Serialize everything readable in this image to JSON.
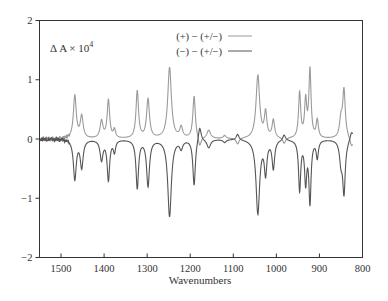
{
  "chart_data": {
    "type": "line",
    "title": "",
    "xlabel": "Wavenumbers",
    "ylabel": "",
    "annotation": "Δ A × 10⁴",
    "xlim": [
      1550,
      800
    ],
    "ylim": [
      -2,
      2
    ],
    "x_ticks": [
      1500,
      1400,
      1300,
      1200,
      1100,
      1000,
      900,
      800
    ],
    "y_ticks": [
      2,
      1,
      0,
      -1,
      -2
    ],
    "grid": false,
    "legend_position": "top-center",
    "series": [
      {
        "name": "(+) − (+/−)",
        "color": "#9a9a9a",
        "peaks": [
          {
            "x": 1468,
            "y": 0.72,
            "w": 4
          },
          {
            "x": 1452,
            "y": 0.37,
            "w": 4
          },
          {
            "x": 1406,
            "y": 0.29,
            "w": 4
          },
          {
            "x": 1390,
            "y": 0.64,
            "w": 3.5
          },
          {
            "x": 1376,
            "y": 0.14,
            "w": 3
          },
          {
            "x": 1323,
            "y": 0.8,
            "w": 3.5
          },
          {
            "x": 1298,
            "y": 0.66,
            "w": 4
          },
          {
            "x": 1248,
            "y": 1.2,
            "w": 5
          },
          {
            "x": 1221,
            "y": 0.18,
            "w": 4
          },
          {
            "x": 1191,
            "y": 0.72,
            "w": 3.5
          },
          {
            "x": 1178,
            "y": -0.17,
            "w": 4
          },
          {
            "x": 1157,
            "y": 0.14,
            "w": 5
          },
          {
            "x": 1120,
            "y": 0.05,
            "w": 4
          },
          {
            "x": 1090,
            "y": -0.1,
            "w": 4
          },
          {
            "x": 1043,
            "y": 1.06,
            "w": 5
          },
          {
            "x": 1025,
            "y": 0.42,
            "w": 3.5
          },
          {
            "x": 1007,
            "y": 0.3,
            "w": 3.5
          },
          {
            "x": 982,
            "y": -0.1,
            "w": 4
          },
          {
            "x": 946,
            "y": 0.76,
            "w": 3
          },
          {
            "x": 932,
            "y": 0.62,
            "w": 3
          },
          {
            "x": 922,
            "y": 1.15,
            "w": 3
          },
          {
            "x": 905,
            "y": 0.3,
            "w": 3
          },
          {
            "x": 850,
            "y": 0.3,
            "w": 4
          },
          {
            "x": 843,
            "y": 0.8,
            "w": 3.5
          },
          {
            "x": 826,
            "y": -0.08,
            "w": 3
          }
        ],
        "end_offset": -0.1
      },
      {
        "name": "(−) − (+/−)",
        "color": "#555555",
        "peaks": [
          {
            "x": 1468,
            "y": -0.67,
            "w": 4
          },
          {
            "x": 1452,
            "y": -0.47,
            "w": 4
          },
          {
            "x": 1406,
            "y": -0.34,
            "w": 4
          },
          {
            "x": 1390,
            "y": -0.68,
            "w": 3.5
          },
          {
            "x": 1376,
            "y": -0.2,
            "w": 3
          },
          {
            "x": 1323,
            "y": -0.82,
            "w": 3.5
          },
          {
            "x": 1298,
            "y": -0.78,
            "w": 4
          },
          {
            "x": 1248,
            "y": -1.3,
            "w": 5
          },
          {
            "x": 1221,
            "y": -0.14,
            "w": 4
          },
          {
            "x": 1191,
            "y": -0.78,
            "w": 3.5
          },
          {
            "x": 1178,
            "y": 0.25,
            "w": 4
          },
          {
            "x": 1157,
            "y": -0.14,
            "w": 5
          },
          {
            "x": 1120,
            "y": -0.05,
            "w": 4
          },
          {
            "x": 1090,
            "y": 0.1,
            "w": 4
          },
          {
            "x": 1043,
            "y": -1.25,
            "w": 5
          },
          {
            "x": 1025,
            "y": -0.55,
            "w": 3.5
          },
          {
            "x": 1007,
            "y": -0.48,
            "w": 3.5
          },
          {
            "x": 982,
            "y": 0.1,
            "w": 4
          },
          {
            "x": 946,
            "y": -0.85,
            "w": 3
          },
          {
            "x": 932,
            "y": -0.7,
            "w": 3
          },
          {
            "x": 922,
            "y": -1.05,
            "w": 3
          },
          {
            "x": 905,
            "y": -0.3,
            "w": 3
          },
          {
            "x": 850,
            "y": -0.35,
            "w": 4
          },
          {
            "x": 843,
            "y": -0.88,
            "w": 3.5
          },
          {
            "x": 826,
            "y": 0.08,
            "w": 3
          }
        ],
        "end_offset": 0.1
      }
    ]
  }
}
